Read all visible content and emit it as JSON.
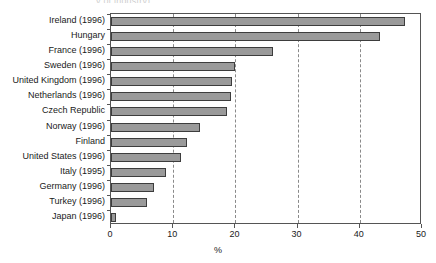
{
  "chart_data": {
    "type": "bar",
    "orientation": "horizontal",
    "title": "",
    "xlabel": "%",
    "ylabel": "",
    "xlim": [
      0,
      50
    ],
    "xticks": [
      0,
      10,
      20,
      30,
      40,
      50
    ],
    "grid": "vertical-dashed",
    "legend": "none",
    "categories": [
      "Ireland (1996)",
      "Hungary",
      "France (1996)",
      "Sweden (1996)",
      "United Kingdom (1996)",
      "Netherlands (1996)",
      "Czech Republic",
      "Norway (1996)",
      "Finland",
      "United States (1996)",
      "Italy (1995)",
      "Germany (1996)",
      "Turkey (1996)",
      "Japan (1996)"
    ],
    "values": [
      47.2,
      43.2,
      26.1,
      20.0,
      19.4,
      19.3,
      18.6,
      14.3,
      12.2,
      11.3,
      8.9,
      6.9,
      5.8,
      0.8
    ],
    "bar_color": "#9a9a9a",
    "bar_edge_color": "#3d3d3d"
  },
  "axis": {
    "x_tick_labels": [
      "0",
      "10",
      "20",
      "30",
      "40",
      "50"
    ],
    "x_axis_title": "%"
  },
  "title_remnant": {
    "text": "y of industry)"
  }
}
